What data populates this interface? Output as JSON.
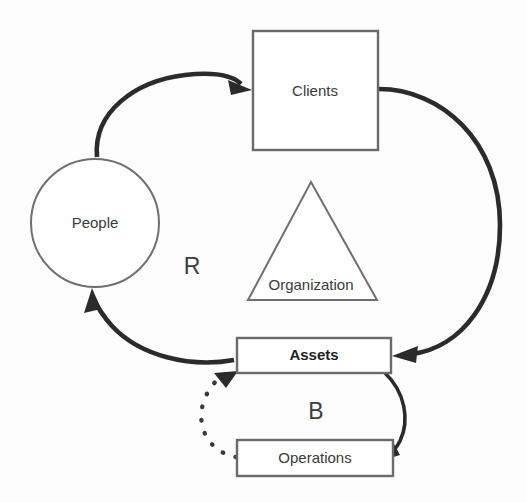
{
  "diagram": {
    "background_color": "#fdfdfd",
    "outline_color": "#6a6a6a",
    "arrow_color": "#2b2b2b",
    "nodes": [
      {
        "id": "people",
        "label": "People",
        "shape": "circle",
        "bold": false,
        "cx": 95,
        "cy": 223,
        "r": 64
      },
      {
        "id": "clients",
        "label": "Clients",
        "shape": "rectangle",
        "bold": false,
        "x": 253,
        "y": 31,
        "width": 125,
        "height": 119
      },
      {
        "id": "organization",
        "label": "Organization",
        "shape": "triangle",
        "bold": false,
        "apex_x": 311,
        "apex_y": 182,
        "base_left_x": 248,
        "base_right_x": 377,
        "base_y": 300
      },
      {
        "id": "assets",
        "label": "Assets",
        "shape": "rectangle",
        "bold": true,
        "x": 237,
        "y": 338,
        "width": 154,
        "height": 35
      },
      {
        "id": "operations",
        "label": "Operations",
        "shape": "rectangle",
        "bold": false,
        "x": 237,
        "y": 440,
        "width": 156,
        "height": 36
      }
    ],
    "loop_labels": [
      {
        "id": "reinforcing",
        "label": "R",
        "x": 192,
        "y": 268
      },
      {
        "id": "balancing",
        "label": "B",
        "x": 316,
        "y": 413
      }
    ],
    "links": [
      {
        "id": "people-to-clients",
        "from": "people",
        "to": "clients",
        "style": "solid",
        "arrow": true
      },
      {
        "id": "clients-to-assets",
        "from": "clients",
        "to": "assets",
        "style": "solid",
        "arrow": true
      },
      {
        "id": "assets-to-people",
        "from": "assets",
        "to": "people",
        "style": "solid",
        "arrow": true
      },
      {
        "id": "assets-to-operations",
        "from": "assets",
        "to": "operations",
        "style": "solid",
        "arrow": true
      },
      {
        "id": "operations-to-assets",
        "from": "operations",
        "to": "assets",
        "style": "dotted",
        "arrow": true
      }
    ]
  }
}
